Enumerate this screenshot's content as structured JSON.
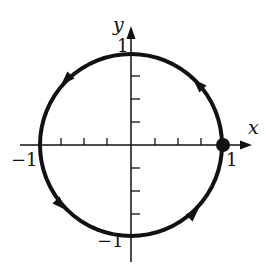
{
  "figure": {
    "axes": {
      "x_label": "x",
      "y_label": "y",
      "x_tick_labels": {
        "neg": "−1",
        "pos": "1"
      },
      "y_tick_labels": {
        "neg": "−1",
        "pos": "1"
      },
      "ticks_per_unit": 4,
      "range": [
        -1,
        1
      ]
    },
    "curve": {
      "type": "circle",
      "center": [
        0,
        0
      ],
      "radius": 1,
      "direction": "counterclockwise",
      "arrow_count": 4
    },
    "marked_point": {
      "coords": [
        1,
        0
      ],
      "style": "filled-dot"
    },
    "colors": {
      "stroke": "#111111",
      "background": "#ffffff"
    }
  }
}
